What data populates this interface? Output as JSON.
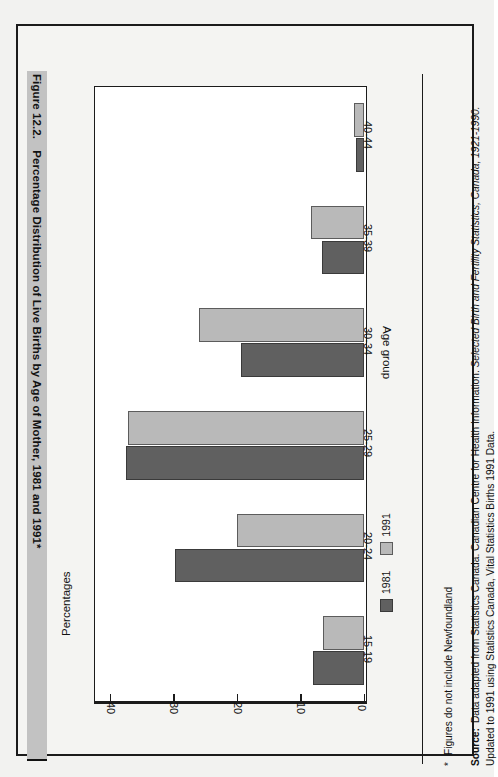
{
  "figure": {
    "number": "Figure 12.2.",
    "title": "Percentage Distribution of Live Births by Age of Mother, 1981 and 1991*"
  },
  "notes": {
    "footnote_marker": "*",
    "footnote_text": "Figures do not include Newfoundland",
    "source_label": "Source:",
    "source_text_1": "Data adapted from Statistics Canada. Canadian Centre for Health Information. ",
    "source_italic_1": "Selected Birth and Fertility Statistics, Canada, 1921-1990.",
    "source_text_2": " Updated to 1991 using Statistics Canada, Vital Statistics Births 1991 Data."
  },
  "legend": {
    "items": [
      {
        "label": "1981",
        "color": "#606060"
      },
      {
        "label": "1991",
        "color": "#b9b9b9"
      }
    ]
  },
  "chart_data": {
    "type": "bar",
    "title": "Percentage Distribution of Live Births by Age of Mother, 1981 and 1991*",
    "xlabel": "Age group",
    "ylabel": "Percentages",
    "categories": [
      "15-19",
      "20-24",
      "25-29",
      "30-34",
      "35-39",
      "40-44"
    ],
    "series": [
      {
        "name": "1981",
        "color": "#606060",
        "values": [
          8.0,
          29.8,
          37.5,
          19.4,
          6.6,
          1.3
        ]
      },
      {
        "name": "1991",
        "color": "#b9b9b9",
        "values": [
          6.5,
          20.0,
          37.2,
          26.0,
          8.3,
          1.5
        ]
      }
    ],
    "ylim": [
      0,
      42
    ],
    "yticks": [
      0,
      10,
      20,
      30,
      40
    ],
    "ytick_labels": [
      "0",
      "10",
      "20",
      "30",
      "40"
    ],
    "grid": false,
    "orientation": "vertical-rotated",
    "legend_position": "bottom-left"
  }
}
